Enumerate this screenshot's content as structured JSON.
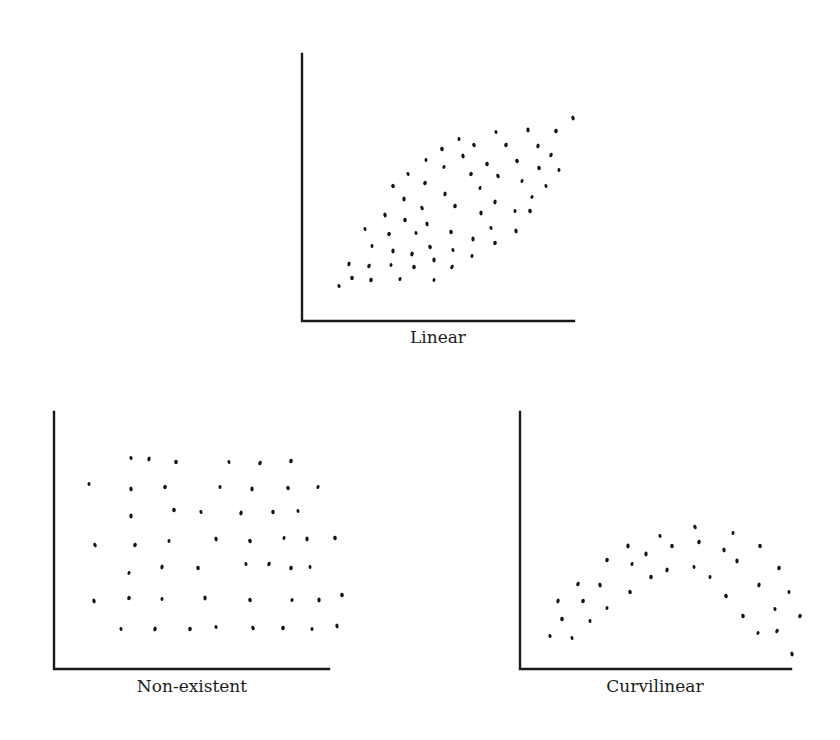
{
  "chart_data": [
    {
      "type": "scatter",
      "title": "Linear",
      "xlabel": "Linear",
      "ylabel": "",
      "grid": false,
      "legend": null,
      "axes_px": {
        "x0": 302,
        "y0": 321,
        "x1": 574,
        "ytop": 54
      },
      "label_px": {
        "x": 438,
        "y": 343
      },
      "points_px": [
        [
          339,
          286
        ],
        [
          349,
          264
        ],
        [
          352,
          278
        ],
        [
          365,
          229
        ],
        [
          369,
          266
        ],
        [
          371,
          280
        ],
        [
          372,
          246
        ],
        [
          385,
          215
        ],
        [
          389,
          234
        ],
        [
          391,
          265
        ],
        [
          393,
          251
        ],
        [
          393,
          186
        ],
        [
          400,
          279
        ],
        [
          404,
          199
        ],
        [
          405,
          220
        ],
        [
          408,
          174
        ],
        [
          412,
          254
        ],
        [
          414,
          267
        ],
        [
          416,
          233
        ],
        [
          422,
          208
        ],
        [
          425,
          183
        ],
        [
          426,
          160
        ],
        [
          427,
          224
        ],
        [
          430,
          247
        ],
        [
          434,
          280
        ],
        [
          434,
          260
        ],
        [
          442,
          149
        ],
        [
          444,
          167
        ],
        [
          445,
          194
        ],
        [
          451,
          232
        ],
        [
          453,
          250
        ],
        [
          452,
          267
        ],
        [
          455,
          206
        ],
        [
          459,
          139
        ],
        [
          463,
          156
        ],
        [
          471,
          174
        ],
        [
          472,
          256
        ],
        [
          473,
          239
        ],
        [
          474,
          145
        ],
        [
          480,
          188
        ],
        [
          481,
          213
        ],
        [
          487,
          164
        ],
        [
          491,
          228
        ],
        [
          495,
          202
        ],
        [
          495,
          243
        ],
        [
          496,
          132
        ],
        [
          498,
          176
        ],
        [
          506,
          145
        ],
        [
          515,
          211
        ],
        [
          516,
          231
        ],
        [
          517,
          161
        ],
        [
          522,
          181
        ],
        [
          528,
          130
        ],
        [
          530,
          211
        ],
        [
          532,
          197
        ],
        [
          538,
          146
        ],
        [
          539,
          168
        ],
        [
          546,
          186
        ],
        [
          551,
          155
        ],
        [
          556,
          131
        ],
        [
          559,
          170
        ],
        [
          573,
          118
        ]
      ]
    },
    {
      "type": "scatter",
      "title": "Non-existent",
      "xlabel": "Non-existent",
      "ylabel": "",
      "grid": false,
      "legend": null,
      "axes_px": {
        "x0": 54,
        "y0": 669,
        "x1": 329,
        "ytop": 412
      },
      "label_px": {
        "x": 192,
        "y": 692
      },
      "points_px": [
        [
          131,
          458
        ],
        [
          149,
          459
        ],
        [
          176,
          462
        ],
        [
          229,
          462
        ],
        [
          260,
          463
        ],
        [
          291,
          461
        ],
        [
          89,
          484
        ],
        [
          131,
          489
        ],
        [
          165,
          487
        ],
        [
          220,
          487
        ],
        [
          252,
          489
        ],
        [
          288,
          488
        ],
        [
          318,
          487
        ],
        [
          131,
          516
        ],
        [
          174,
          510
        ],
        [
          201,
          512
        ],
        [
          241,
          513
        ],
        [
          273,
          512
        ],
        [
          298,
          511
        ],
        [
          95,
          545
        ],
        [
          135,
          545
        ],
        [
          169,
          541
        ],
        [
          216,
          539
        ],
        [
          250,
          541
        ],
        [
          284,
          538
        ],
        [
          307,
          539
        ],
        [
          335,
          538
        ],
        [
          129,
          573
        ],
        [
          162,
          567
        ],
        [
          198,
          568
        ],
        [
          246,
          564
        ],
        [
          269,
          564
        ],
        [
          291,
          568
        ],
        [
          310,
          567
        ],
        [
          94,
          601
        ],
        [
          129,
          598
        ],
        [
          162,
          599
        ],
        [
          205,
          598
        ],
        [
          250,
          600
        ],
        [
          292,
          600
        ],
        [
          319,
          600
        ],
        [
          342,
          595
        ],
        [
          121,
          629
        ],
        [
          155,
          629
        ],
        [
          190,
          629
        ],
        [
          216,
          627
        ],
        [
          253,
          628
        ],
        [
          283,
          628
        ],
        [
          312,
          629
        ],
        [
          337,
          626
        ]
      ]
    },
    {
      "type": "scatter",
      "title": "Curvilinear",
      "xlabel": "Curvilinear",
      "ylabel": "",
      "grid": false,
      "legend": null,
      "axes_px": {
        "x0": 520,
        "y0": 669,
        "x1": 791,
        "ytop": 412
      },
      "label_px": {
        "x": 655,
        "y": 692
      },
      "points_px": [
        [
          550,
          636
        ],
        [
          558,
          601
        ],
        [
          562,
          619
        ],
        [
          572,
          638
        ],
        [
          578,
          584
        ],
        [
          583,
          601
        ],
        [
          590,
          621
        ],
        [
          600,
          585
        ],
        [
          607,
          560
        ],
        [
          607,
          608
        ],
        [
          628,
          546
        ],
        [
          630,
          592
        ],
        [
          632,
          564
        ],
        [
          646,
          554
        ],
        [
          651,
          577
        ],
        [
          660,
          536
        ],
        [
          667,
          570
        ],
        [
          672,
          546
        ],
        [
          694,
          567
        ],
        [
          695,
          527
        ],
        [
          699,
          542
        ],
        [
          710,
          577
        ],
        [
          724,
          550
        ],
        [
          726,
          596
        ],
        [
          733,
          533
        ],
        [
          737,
          561
        ],
        [
          743,
          616
        ],
        [
          758,
          633
        ],
        [
          759,
          585
        ],
        [
          760,
          546
        ],
        [
          775,
          609
        ],
        [
          777,
          631
        ],
        [
          779,
          568
        ],
        [
          789,
          592
        ],
        [
          792,
          654
        ],
        [
          800,
          616
        ]
      ]
    }
  ],
  "labels": {
    "linear": "Linear",
    "nonexistent": "Non-existent",
    "curvilinear": "Curvilinear"
  },
  "colors": {
    "axis": "#1a1a1a",
    "dot": "#141414",
    "background": "#ffffff"
  }
}
